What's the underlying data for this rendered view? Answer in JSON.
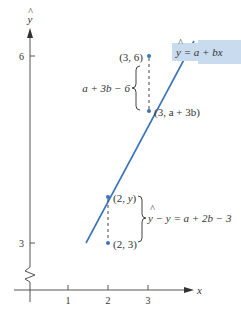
{
  "axes": {
    "x_label": "x",
    "y_label": "y",
    "y_hat_mark": "^",
    "x_ticks": [
      "1",
      "2",
      "3"
    ],
    "y_ticks": [
      "3",
      "6"
    ],
    "axis_break": "zigzag"
  },
  "regression_line": {
    "label_hat": "^",
    "label_y": "y",
    "label_rest": " = a + bx",
    "color": "#3b74b8",
    "label_bg": "#c9dcef"
  },
  "points": [
    {
      "id": "p36",
      "label": "(3, 6)"
    },
    {
      "id": "p3ab",
      "label": "(3, a + 3b)"
    },
    {
      "id": "p2yhat",
      "label_prefix": "(2, ",
      "label_var": "y",
      "label_suffix": ")"
    },
    {
      "id": "p23",
      "label": "(2, 3)"
    }
  ],
  "annotations": {
    "upper_residual": "a + 3b − 6",
    "lower_residual_hat": "^",
    "lower_residual_y1": "y",
    "lower_residual_rest": " − y = a + 2b − 3"
  },
  "colors": {
    "axis": "#555555",
    "point": "#3b74b8",
    "text": "#333333"
  }
}
